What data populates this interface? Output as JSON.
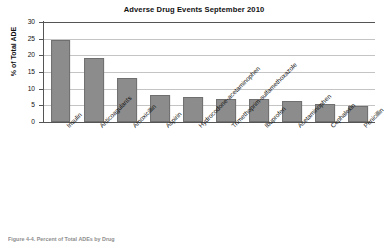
{
  "chart_data": {
    "type": "bar",
    "title": "Adverse Drug Events September 2010",
    "xlabel": "",
    "ylabel": "% of Total ADE",
    "ylim": [
      0,
      30
    ],
    "yticks": [
      0,
      5,
      10,
      15,
      20,
      25,
      30
    ],
    "grid": true,
    "legend": null,
    "bar_color": "#8c8c8c",
    "categories": [
      "Insulin",
      "Anticoagulants",
      "Amoxicillin",
      "Aspirin",
      "Hydrocodone-acetaminophen",
      "Trimethoprim-sulfamethoxazole",
      "Ibuprofen",
      "Acetaminophen",
      "Cephalexin",
      "Penicillin"
    ],
    "values": [
      24.6,
      19.3,
      13.3,
      8.2,
      7.4,
      7.0,
      7.0,
      6.3,
      5.5,
      4.8
    ]
  },
  "caption": {
    "text": "Figure 4-4. Percent of Total ADEs by Drug"
  }
}
